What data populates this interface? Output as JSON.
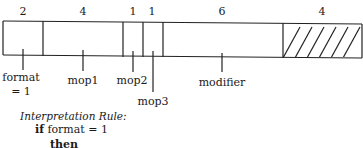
{
  "fields": [
    {
      "name": "format",
      "width": "2",
      "label": "format",
      "sublabel": "= 1"
    },
    {
      "name": "mop1",
      "width": "4",
      "label": "mop1"
    },
    {
      "name": "mop2",
      "width": "1",
      "label": "mop2"
    },
    {
      "name": "mop3",
      "width": "1",
      "label": "mop3"
    },
    {
      "name": "modifier",
      "width": "6",
      "label": "modifier"
    },
    {
      "name": "unused",
      "width": "4",
      "hatched": true
    }
  ],
  "rule": {
    "title": "Interpretation Rule:",
    "line1_kw": "if",
    "line1_rest": "format = 1",
    "line2_kw": "then"
  }
}
